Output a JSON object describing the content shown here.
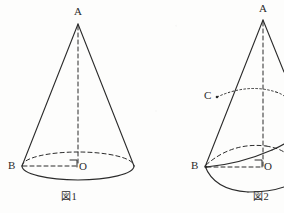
{
  "page": {
    "background_color": "#fdfdfc",
    "ink_color": "#2b2b2b"
  },
  "figures": [
    {
      "id": "figure-1",
      "caption": "図1",
      "caption_kanji": "図",
      "caption_number": "1",
      "labels": {
        "apex": "A",
        "base_point": "B",
        "center": "O"
      },
      "right_angle_mark": true,
      "notes": "Upright circular cone: apex A at top, dashed vertical axis AO to base centre O, dashed radius BO to point B on the left of the base ellipse, dashed hidden back half of base circle."
    },
    {
      "id": "figure-2",
      "caption": "図2",
      "caption_kanji": "図",
      "caption_number": "2",
      "labels": {
        "apex": "A",
        "base_point": "B",
        "center": "O",
        "slant_point": "C"
      },
      "right_angle_mark": true,
      "clipped_right_edge": true,
      "notes": "Same cone tilted/rolled: apex A, point C marked on the left slant edge AB, dotted arc from C across the cone, dashed vertical axis AO, dashed radius BO with right-angle mark at O, solid swept arc below the base."
    }
  ]
}
